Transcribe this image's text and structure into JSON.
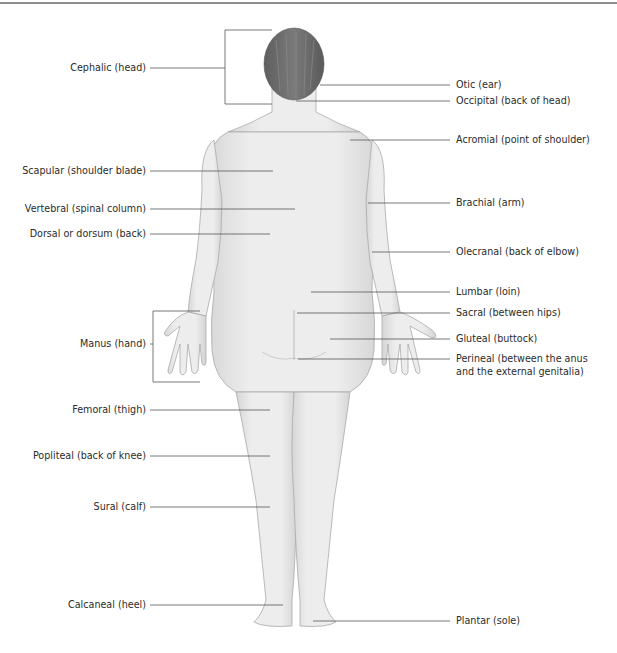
{
  "figure": {
    "view": "posterior",
    "colors": {
      "skin": "#ececec",
      "skin_outline": "#a9a9a9",
      "hair": "#6e6e6e",
      "leader_line": "#555555",
      "top_rule": "#8e8e8e"
    }
  },
  "labels_left": [
    {
      "id": "cephalic",
      "text": "Cephalic (head)"
    },
    {
      "id": "scapular",
      "text": "Scapular (shoulder blade)"
    },
    {
      "id": "vertebral",
      "text": "Vertebral (spinal column)"
    },
    {
      "id": "dorsal",
      "text": "Dorsal or dorsum (back)"
    },
    {
      "id": "manus",
      "text": "Manus (hand)"
    },
    {
      "id": "femoral",
      "text": "Femoral (thigh)"
    },
    {
      "id": "popliteal",
      "text": "Popliteal (back of knee)"
    },
    {
      "id": "sural",
      "text": "Sural (calf)"
    },
    {
      "id": "calcaneal",
      "text": "Calcaneal (heel)"
    }
  ],
  "labels_right": [
    {
      "id": "otic",
      "text": "Otic (ear)"
    },
    {
      "id": "occipital",
      "text": "Occipital (back of head)"
    },
    {
      "id": "acromial",
      "text": "Acromial (point of shoulder)"
    },
    {
      "id": "brachial",
      "text": "Brachial (arm)"
    },
    {
      "id": "olecranal",
      "text": "Olecranal (back of elbow)"
    },
    {
      "id": "lumbar",
      "text": "Lumbar (loin)"
    },
    {
      "id": "sacral",
      "text": "Sacral (between hips)"
    },
    {
      "id": "gluteal",
      "text": "Gluteal (buttock)"
    },
    {
      "id": "perineal_line1",
      "text": "Perineal (between the anus"
    },
    {
      "id": "perineal_line2",
      "text": "and the external genitalia)"
    },
    {
      "id": "plantar",
      "text": "Plantar (sole)"
    }
  ]
}
